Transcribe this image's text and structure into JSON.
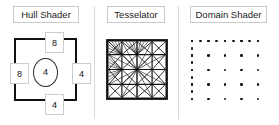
{
  "diagram": {
    "panels": [
      {
        "id": "hull",
        "label": "Hull Shader",
        "patch": {
          "shape": "quad",
          "edge_factors": {
            "top": "8",
            "left": "8",
            "right": "4",
            "bottom": "4"
          },
          "inside_factor": "4"
        }
      },
      {
        "id": "tesselator",
        "label": "Tesselator",
        "mesh": {
          "type": "triangulated-quad",
          "grid_columns": 4,
          "grid_rows": 4,
          "fan_cells": 4,
          "outline_color": "#111111"
        }
      },
      {
        "id": "domain",
        "label": "Domain Shader",
        "points": {
          "top_edge_count": 9,
          "left_edge_count": 9,
          "bottom_edge_count": 5,
          "right_edge_count": 5,
          "interior_columns": 5,
          "interior_rows": 5,
          "dot_color": "#161616"
        }
      }
    ],
    "colors": {
      "background": "#ffffff",
      "ink": "#111111",
      "label_border": "#c9c9c9",
      "divider": "#d8d8d8"
    }
  }
}
